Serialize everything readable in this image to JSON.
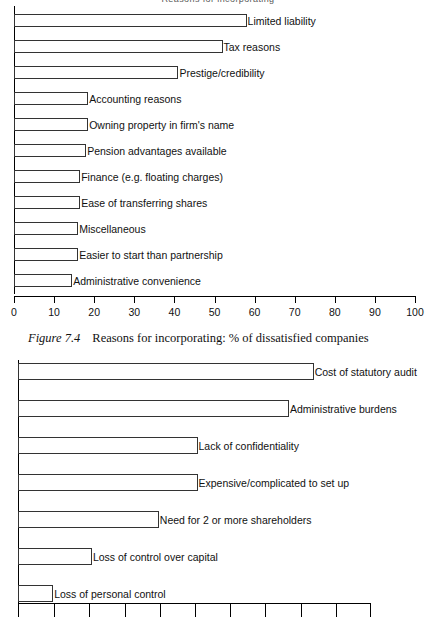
{
  "page": {
    "top_cut_text": "Reasons for incorporating"
  },
  "caption": {
    "prefix": "Figure 7.4",
    "text": "Reasons for incorporating: % of dissatisfied companies"
  },
  "chart_data": [
    {
      "id": "chart-upper",
      "type": "bar",
      "orientation": "horizontal",
      "title": "",
      "xlabel": "",
      "ylabel": "",
      "xlim": [
        0,
        100
      ],
      "grid": false,
      "legend": "none",
      "ticks": [
        "0",
        "10",
        "20",
        "30",
        "40",
        "50",
        "60",
        "70",
        "80",
        "90",
        "100"
      ],
      "categories": [
        "Limited liability",
        "Tax reasons",
        "Prestige/credibility",
        "Accounting reasons",
        "Owning property in firm's name",
        "Pension advantages available",
        "Finance (e.g. floating charges)",
        "Ease of transferring shares",
        "Miscellaneous",
        "Easier to start than partnership",
        "Administrative convenience"
      ],
      "values": [
        58,
        52,
        41,
        18.5,
        18.5,
        18,
        16.5,
        16.5,
        16,
        16,
        14.5
      ]
    },
    {
      "id": "chart-lower",
      "type": "bar",
      "orientation": "horizontal",
      "title": "",
      "xlabel": "",
      "ylabel": "",
      "xlim": [
        0,
        100
      ],
      "grid": false,
      "legend": "none",
      "ticks": [
        "",
        "",
        "",
        "",
        "",
        "",
        "",
        "",
        "",
        "",
        ""
      ],
      "categories": [
        "Cost of statutory audit",
        "Administrative burdens",
        "Lack of confidentiality",
        "Expensive/complicated to set up",
        "Need for 2 or more shareholders",
        "Loss of control over capital",
        "Loss of personal control"
      ],
      "values": [
        84,
        77,
        51,
        51,
        40,
        21,
        10
      ]
    }
  ]
}
